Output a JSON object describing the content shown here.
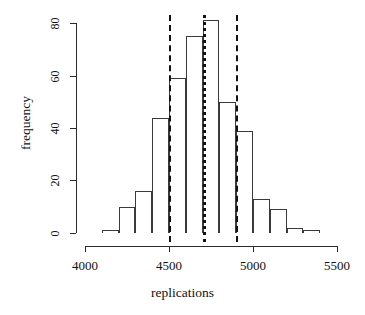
{
  "chart_data": {
    "type": "bar",
    "title": "",
    "subtitle": "",
    "xlabel": "replications",
    "ylabel": "frequency",
    "xlim": [
      4000,
      5500
    ],
    "ylim": [
      0,
      80
    ],
    "xticks": [
      4000,
      4500,
      5000,
      5500
    ],
    "yticks": [
      0,
      20,
      40,
      60,
      80
    ],
    "grid": false,
    "legend": null,
    "bin_width": 100,
    "bin_starts": [
      4100,
      4200,
      4300,
      4400,
      4500,
      4600,
      4700,
      4800,
      4900,
      5000,
      5100,
      5200,
      5300
    ],
    "categories": [
      "4100-4200",
      "4200-4300",
      "4300-4400",
      "4400-4500",
      "4500-4600",
      "4600-4700",
      "4700-4800",
      "4800-4900",
      "4900-5000",
      "5000-5100",
      "5100-5200",
      "5200-5300",
      "5300-5400"
    ],
    "values": [
      1,
      10,
      16,
      44,
      59,
      75,
      81,
      50,
      39,
      13,
      9,
      2,
      1
    ],
    "annotations": [
      {
        "name": "lower-reference-line",
        "type": "vline",
        "x": 4500,
        "style": "dashed"
      },
      {
        "name": "center-reference-line",
        "type": "vline",
        "x": 4700,
        "style": "dotted"
      },
      {
        "name": "upper-reference-line",
        "type": "vline",
        "x": 4900,
        "style": "dashed"
      }
    ]
  },
  "axes": {
    "x_label": "replications",
    "y_label": "frequency",
    "x_tick_labels": [
      "4000",
      "4500",
      "5000",
      "5500"
    ],
    "y_tick_labels": [
      "0",
      "20",
      "40",
      "60",
      "80"
    ]
  },
  "colors": {
    "axis": "#2b2b2b",
    "bar_outline": "#3a3a3a",
    "reference_line": "#121212",
    "background": "#ffffff"
  }
}
